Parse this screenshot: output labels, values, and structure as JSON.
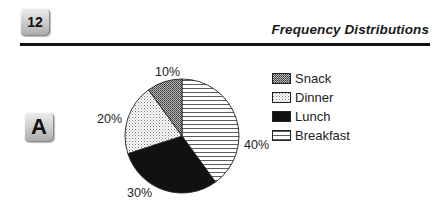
{
  "header": {
    "chapter_number": "12",
    "title": "Frequency Distributions"
  },
  "section": {
    "label": "A"
  },
  "chart_data": {
    "type": "pie",
    "title": "",
    "categories": [
      "Breakfast",
      "Lunch",
      "Dinner",
      "Snack"
    ],
    "values": [
      40,
      30,
      20,
      10
    ],
    "labels": [
      "40%",
      "30%",
      "20%",
      "10%"
    ],
    "start_angle_deg": 0,
    "direction": "clockwise",
    "legend": {
      "position": "right",
      "entries": [
        "Snack",
        "Dinner",
        "Lunch",
        "Breakfast"
      ]
    },
    "fills": {
      "Breakfast": "horizontal-lines",
      "Lunch": "solid-black",
      "Dinner": "light-dots",
      "Snack": "dense-crosshatch"
    }
  },
  "colors": {
    "ink": "#111111",
    "background": "#ffffff"
  }
}
